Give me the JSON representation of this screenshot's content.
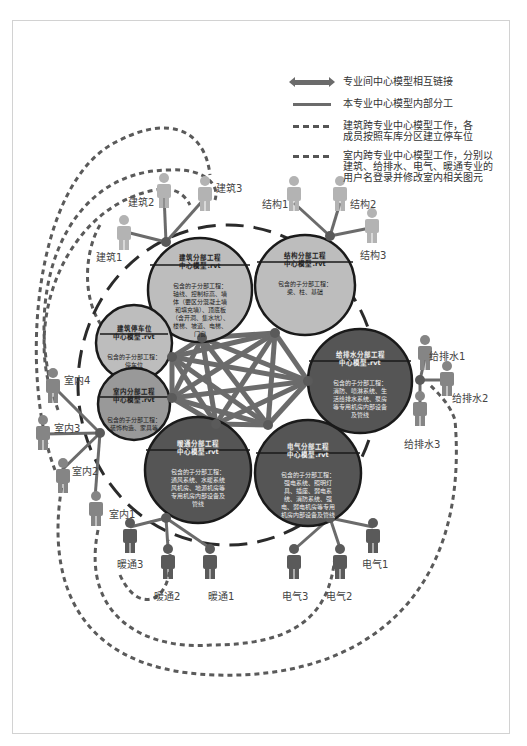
{
  "legend": {
    "items": [
      {
        "symbol": "double-arrow",
        "text": "专业间中心模型相互链接"
      },
      {
        "symbol": "solid-line",
        "text": "本专业中心模型内部分工"
      },
      {
        "symbol": "dashed-line",
        "text": "建筑跨专业中心模型工作，各\n成员按照车库分区建立停车位"
      },
      {
        "symbol": "dashed-line",
        "text": "室内跨专业中心模型工作，分别以\n建筑、给排水、电气、暖通专业的\n用户名登录并修改室内相关图元"
      }
    ]
  },
  "colors": {
    "light_hub": "#bdbdbd",
    "dark_hub": "#555555",
    "link": "#6b6b6b",
    "person_light": "#b3b3b3",
    "person_dark": "#5a5a5a",
    "frame": "#d2d2d2"
  },
  "hubs": [
    {
      "id": "arch",
      "title": "建筑分部工程\n中心模型.rvt",
      "body": "包含的子分部工程：\n轴线、控制标高、墙\n体（要区分混凝土墙\n和填充墙）、顶底板\n（含开洞、集水坑）、\n楼梯、坡道、电梯、\n门窗"
    },
    {
      "id": "struct",
      "title": "结构分部工程\n中心模型.rvt",
      "body": "包含的子分部工程：\n梁、柱、基础"
    },
    {
      "id": "parking",
      "title": "建筑停车位\n中心模型.rvt",
      "body": "包含的子分部工程：\n停车位"
    },
    {
      "id": "interior",
      "title": "室内分部工程\n中心模型.rvt",
      "body": "包含的子分部工程：\n装饰构造、家具等"
    },
    {
      "id": "plumbing",
      "title": "给排水分部工程\n中心模型.rvt",
      "body": "包含的子分部工程：\n消防、喷淋系统、生\n活给排水系统、泵房\n等专用机房内部设备\n及管线"
    },
    {
      "id": "hvac",
      "title": "暖通分部工程\n中心模型.rvt",
      "body": "包含的子分部工程：\n通风系统、水暖系统\n风机房、地源机房等\n专用机房内部设备及\n管线"
    },
    {
      "id": "elec",
      "title": "电气分部工程\n中心模型.rvt",
      "body": "包含的子分部工程：\n强电系统、照明灯\n具、插座、弱电系\n统、消防系统、强\n电、弱电机房等专用\n机房内部设备及管线"
    }
  ],
  "people": {
    "arch": [
      "建筑1",
      "建筑2",
      "建筑3"
    ],
    "struct": [
      "结构1",
      "结构2",
      "结构3"
    ],
    "plumbing": [
      "给排水1",
      "给排水2",
      "给排水3"
    ],
    "interior": [
      "室内1",
      "室内2",
      "室内3",
      "室内4"
    ],
    "hvac": [
      "暖通1",
      "暖通2",
      "暖通3"
    ],
    "elec": [
      "电气1",
      "电气2",
      "电气3"
    ]
  }
}
